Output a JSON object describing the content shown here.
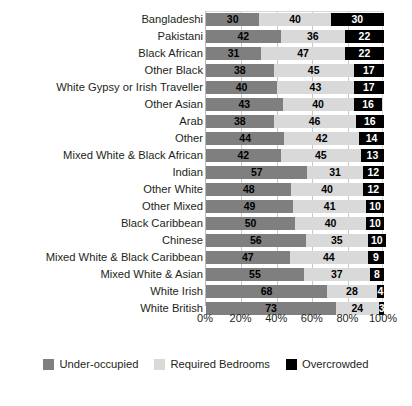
{
  "chart_data": {
    "type": "bar",
    "subtype": "stacked-horizontal-bar",
    "title": "",
    "xlabel": "",
    "ylabel": "",
    "xlim": [
      0,
      100
    ],
    "xticks": [
      "0%",
      "20%",
      "40%",
      "60%",
      "80%",
      "100%"
    ],
    "xtick_values": [
      0,
      20,
      40,
      60,
      80,
      100
    ],
    "grid": true,
    "legend_position": "bottom",
    "categories": [
      "Bangladeshi",
      "Pakistani",
      "Black African",
      "Other Black",
      "White Gypsy or Irish Traveller",
      "Other Asian",
      "Arab",
      "Other",
      "Mixed White & Black African",
      "Indian",
      "Other White",
      "Other Mixed",
      "Black Caribbean",
      "Chinese",
      "Mixed White & Black Caribbean",
      "Mixed White & Asian",
      "White Irish",
      "White British"
    ],
    "series": [
      {
        "name": "Under-occupied",
        "color": "#7f7f7f",
        "values": [
          30,
          42,
          31,
          38,
          40,
          43,
          38,
          44,
          42,
          57,
          48,
          49,
          50,
          56,
          47,
          55,
          68,
          73
        ]
      },
      {
        "name": "Required Bedrooms",
        "color": "#d9d9d9",
        "values": [
          40,
          36,
          47,
          45,
          43,
          40,
          46,
          42,
          45,
          31,
          40,
          41,
          40,
          35,
          44,
          37,
          28,
          24
        ]
      },
      {
        "name": "Overcrowded",
        "color": "#000000",
        "values": [
          30,
          22,
          22,
          17,
          17,
          16,
          16,
          14,
          13,
          12,
          12,
          10,
          10,
          10,
          9,
          8,
          4,
          3
        ]
      }
    ]
  },
  "legend": {
    "items": [
      {
        "label": "Under-occupied",
        "color": "#7f7f7f"
      },
      {
        "label": "Required Bedrooms",
        "color": "#d9d9d9"
      },
      {
        "label": "Overcrowded",
        "color": "#000000"
      }
    ]
  }
}
